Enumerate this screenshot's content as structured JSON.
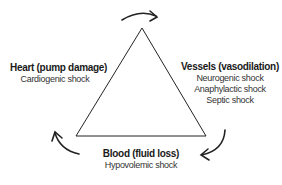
{
  "diagram": {
    "type": "shock-triangle",
    "nodes": [
      {
        "id": "heart",
        "title": "Heart (pump damage)",
        "items": [
          "Cardiogenic shock"
        ]
      },
      {
        "id": "vessels",
        "title": "Vessels (vasodilation)",
        "items": [
          "Neurogenic shock",
          "Anaphylactic shock",
          "Septic shock"
        ]
      },
      {
        "id": "blood",
        "title": "Blood (fluid loss)",
        "items": [
          "Hypovolemic shock"
        ]
      }
    ],
    "colors": {
      "line": "#222222",
      "text": "#1a1a1a"
    }
  }
}
